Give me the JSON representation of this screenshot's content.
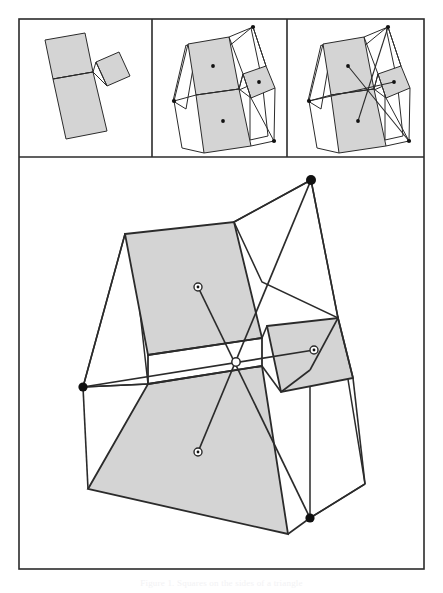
{
  "figure": {
    "caption_text": "Figure 1. Squares on the sides of a triangle",
    "background_color": "#ffffff",
    "frame": {
      "stroke_color": "#2b2b2b",
      "stroke_width": 1.6,
      "x": 19,
      "y": 19,
      "width": 405,
      "height": 550,
      "divider_y": 157,
      "divider_x1": 152,
      "divider_x2": 287
    },
    "style": {
      "square_fill": "#d4d4d4",
      "square_stroke": "#2b2b2b",
      "outer_fill": "#ffffff",
      "line_stroke": "#2b2b2b",
      "dot_fill": "#111111",
      "open_dot_fill": "#ffffff"
    },
    "panels": [
      {
        "name": "panel-1-squares-only",
        "label": "Squares erected on the triangle sides",
        "shows": [
          "triangle",
          "three squares"
        ]
      },
      {
        "name": "panel-2-outer-quads",
        "label": "Outer quadrilaterals and square centers",
        "shows": [
          "triangle",
          "three squares",
          "square center dots",
          "outer flank quadrilaterals"
        ]
      },
      {
        "name": "panel-3-cevians",
        "label": "Cevians from square centers meeting at a common point",
        "shows": [
          "triangle",
          "three squares",
          "square center dots",
          "outer flank quadrilaterals",
          "concurrent cevians"
        ]
      }
    ],
    "main_panel": {
      "name": "main-enlarged-figure",
      "label": "Enlarged final construction",
      "marked_points": [
        {
          "name": "outer-vertex-top",
          "type": "filled",
          "x": 311,
          "y": 180
        },
        {
          "name": "outer-vertex-left",
          "type": "filled",
          "x": 83,
          "y": 387
        },
        {
          "name": "outer-vertex-bottom-right",
          "type": "filled",
          "x": 310,
          "y": 518
        },
        {
          "name": "center-large-square",
          "type": "open",
          "x": 198,
          "y": 287
        },
        {
          "name": "center-small-square",
          "type": "open",
          "x": 314,
          "y": 350
        },
        {
          "name": "center-bottom-square",
          "type": "open",
          "x": 198,
          "y": 452
        },
        {
          "name": "concurrency-point",
          "type": "open",
          "x": 236,
          "y": 362
        }
      ],
      "triangle_vertices": [
        {
          "name": "triangle-vertex-a",
          "x": 214,
          "y": 355
        },
        {
          "name": "triangle-vertex-b",
          "x": 148,
          "y": 384
        },
        {
          "name": "triangle-vertex-c",
          "x": 262,
          "y": 383
        }
      ]
    }
  }
}
